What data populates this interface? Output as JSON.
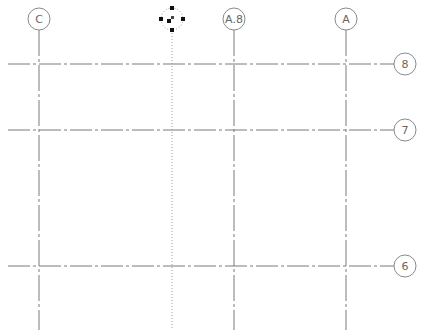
{
  "view": {
    "type": "structural grid plan",
    "background": "#ffffff",
    "line_color": "#7a7a7a",
    "bubble_color": "#8a8a8a"
  },
  "vertical_grids": [
    {
      "label": "C",
      "x": 39,
      "bubble_y": 19,
      "selected": false
    },
    {
      "label": "",
      "x": 172,
      "bubble_y": 19,
      "selected": true
    },
    {
      "label": "A.8",
      "x": 234,
      "bubble_y": 19,
      "selected": false
    },
    {
      "label": "A",
      "x": 346,
      "bubble_y": 19,
      "selected": false
    }
  ],
  "horizontal_grids": [
    {
      "label": "8",
      "y": 64,
      "bubble_x": 405
    },
    {
      "label": "7",
      "y": 130,
      "bubble_x": 405
    },
    {
      "label": "6",
      "y": 266,
      "bubble_x": 405
    }
  ],
  "selection": {
    "grips": 5,
    "grip_color": "#111111"
  }
}
